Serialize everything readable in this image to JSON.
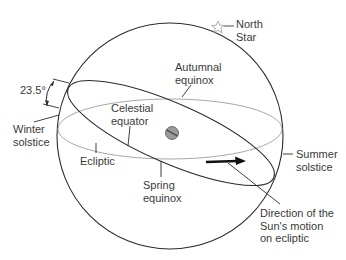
{
  "diagram": {
    "labels": {
      "north_star": "North\nStar",
      "autumnal_equinox": "Autumnal\nequinox",
      "angle": "23.5°",
      "celestial_equator": "Celestial\nequator",
      "winter_solstice": "Winter\nsolstice",
      "ecliptic": "Ecliptic",
      "spring_equinox": "Spring\nequinox",
      "summer_solstice": "Summer\nsolstice",
      "sun_motion": "Direction of the\nSun's motion\non ecliptic"
    },
    "elements": {
      "sphere": "celestial-sphere",
      "earth": "earth-globe",
      "star": "north-star-icon",
      "arrow": "sun-direction-arrow"
    },
    "colors": {
      "sphere_stroke": "#2b2b2b",
      "ecliptic_stroke": "#2b2b2b",
      "equator_stroke": "#a8a8a8",
      "earth_fill": "#9a9a9a",
      "text": "#3a3a3a"
    }
  }
}
